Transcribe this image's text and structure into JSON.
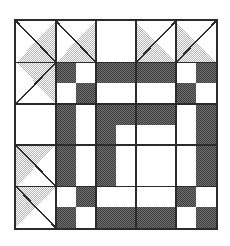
{
  "artwork": {
    "title": "Quilt Block Pattern",
    "kind": "pieced-quilt-block-diagram",
    "description": "Square quilt block: five-by-five outer grid of half-square triangle units framing a dark chequerboard chain medallion with a plain square centre.",
    "canvas": {
      "width": 230,
      "height": 246,
      "background": "#ffffff"
    },
    "block": {
      "left": 14,
      "top": 19,
      "width": 204,
      "height": 211,
      "border_color": "#2b2b2b",
      "border_width": 2,
      "fill": "#ffffff"
    },
    "colors": {
      "outline": "#2b2b2b",
      "background": "#ffffff",
      "light_patch": "#ffffff",
      "medium_patch": "#bdbdbd",
      "dark_patch": "#4a4a4a",
      "grid_line": "#2b2b2b"
    },
    "grid": {
      "outer_rows": 5,
      "outer_cols": 5,
      "inner_rows": 8,
      "inner_cols": 8,
      "column_edges": [
        0,
        41,
        82,
        123,
        164,
        204
      ],
      "row_edges": [
        0,
        42,
        85,
        127,
        169,
        211
      ]
    },
    "legend": [
      {
        "swatch": "light",
        "label": "Background / white patch",
        "color": "#ffffff"
      },
      {
        "swatch": "medium",
        "label": "Shaded triangle patch",
        "color": "#bdbdbd"
      },
      {
        "swatch": "dark",
        "label": "Chain patch",
        "color": "#4a4a4a"
      }
    ],
    "patches": {
      "triangles": [
        {
          "name": "corner-top-left",
          "cell": [
            0,
            0
          ],
          "hypotenuse": "tl-br",
          "shaded_corner": "bottom-right",
          "tone": "medium"
        },
        {
          "name": "edge-top-inner-left",
          "cell": [
            0,
            1
          ],
          "hypotenuse": "tl-br",
          "shaded_corner": "bottom-right",
          "tone": "medium"
        },
        {
          "name": "edge-top-center",
          "cell": [
            0,
            2
          ],
          "hypotenuse": "none",
          "shaded_corner": "none",
          "tone": "light"
        },
        {
          "name": "edge-top-inner-right",
          "cell": [
            0,
            3
          ],
          "hypotenuse": "tr-bl",
          "shaded_corner": "bottom-left",
          "tone": "medium"
        },
        {
          "name": "corner-top-right",
          "cell": [
            0,
            4
          ],
          "hypotenuse": "tr-bl",
          "shaded_corner": "bottom-left",
          "tone": "medium"
        },
        {
          "name": "edge-left-upper",
          "cell": [
            1,
            0
          ],
          "hypotenuse": "tr-bl",
          "shaded_corner": "top-right",
          "tone": "medium"
        },
        {
          "name": "edge-right-upper",
          "cell": [
            1,
            4
          ],
          "hypotenuse": "tl-br",
          "shaded_corner": "top-left",
          "tone": "medium"
        },
        {
          "name": "edge-left-middle",
          "cell": [
            2,
            0
          ],
          "hypotenuse": "none",
          "shaded_corner": "none",
          "tone": "light"
        },
        {
          "name": "edge-right-middle",
          "cell": [
            2,
            4
          ],
          "hypotenuse": "none",
          "shaded_corner": "none",
          "tone": "light"
        },
        {
          "name": "edge-left-lower",
          "cell": [
            3,
            0
          ],
          "hypotenuse": "tl-br",
          "shaded_corner": "top-left",
          "tone": "medium"
        },
        {
          "name": "edge-right-lower",
          "cell": [
            3,
            4
          ],
          "hypotenuse": "tr-bl",
          "shaded_corner": "top-right",
          "tone": "medium"
        },
        {
          "name": "corner-bottom-left",
          "cell": [
            4,
            0
          ],
          "hypotenuse": "tl-br",
          "shaded_corner": "top-left",
          "tone": "medium"
        },
        {
          "name": "edge-bottom-inner-left",
          "cell": [
            4,
            1
          ],
          "hypotenuse": "tl-br",
          "shaded_corner": "top-left",
          "tone": "medium"
        },
        {
          "name": "edge-bottom-center",
          "cell": [
            4,
            2
          ],
          "hypotenuse": "none",
          "shaded_corner": "none",
          "tone": "light"
        },
        {
          "name": "edge-bottom-inner-right",
          "cell": [
            4,
            3
          ],
          "hypotenuse": "tr-bl",
          "shaded_corner": "top-right",
          "tone": "medium"
        },
        {
          "name": "corner-bottom-right",
          "cell": [
            4,
            4
          ],
          "hypotenuse": "tr-bl",
          "shaded_corner": "top-right",
          "tone": "medium"
        }
      ],
      "chain_matrix": [
        [
          1,
          0,
          1,
          1,
          1,
          1,
          0,
          1
        ],
        [
          0,
          1,
          0,
          0,
          0,
          0,
          1,
          0
        ],
        [
          1,
          0,
          1,
          1,
          1,
          1,
          0,
          1
        ],
        [
          1,
          0,
          1,
          0,
          0,
          1,
          0,
          1
        ],
        [
          1,
          0,
          1,
          0,
          0,
          1,
          0,
          1
        ],
        [
          1,
          0,
          1,
          1,
          1,
          1,
          0,
          1
        ],
        [
          0,
          1,
          0,
          0,
          0,
          0,
          1,
          0
        ],
        [
          1,
          0,
          1,
          1,
          1,
          1,
          0,
          1
        ]
      ],
      "chain_region": {
        "row_start": 1,
        "row_end": 4,
        "col_start": 1,
        "col_end": 4
      },
      "center_square": {
        "inner_rows": [
          3,
          5
        ],
        "inner_cols": [
          3,
          5
        ],
        "tone": "light"
      }
    }
  }
}
